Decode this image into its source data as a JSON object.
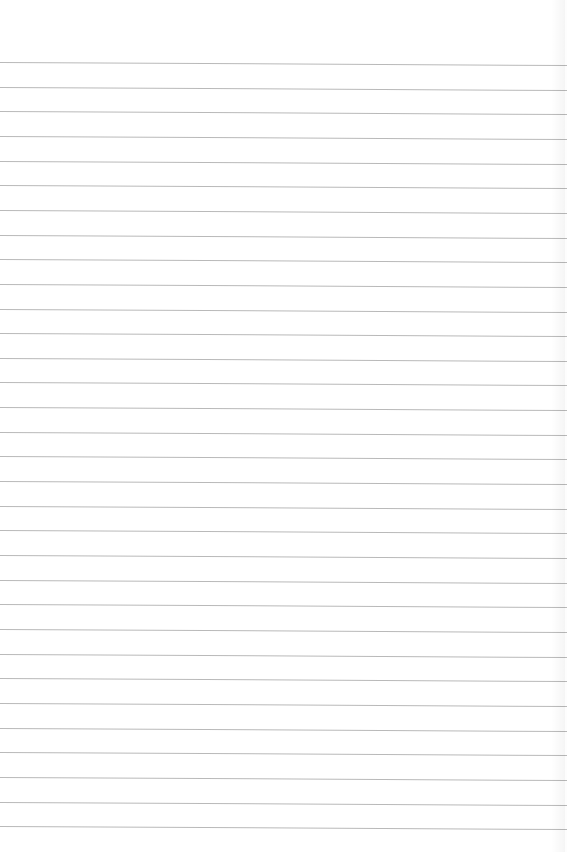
{
  "paper": {
    "type": "lined-paper",
    "background_color": "#ffffff",
    "line_color": "#b9b9b9",
    "first_line_y": 62,
    "line_spacing": 24.65,
    "line_count": 32
  }
}
